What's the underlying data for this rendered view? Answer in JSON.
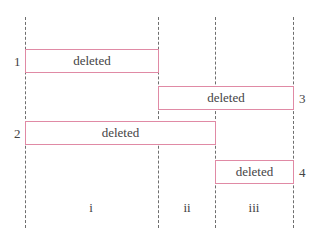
{
  "diagram": {
    "boxes": [
      {
        "id": "1",
        "label": "deleted"
      },
      {
        "id": "3",
        "label": "deleted"
      },
      {
        "id": "2",
        "label": "deleted"
      },
      {
        "id": "4",
        "label": "deleted"
      }
    ],
    "columns": [
      "i",
      "ii",
      "iii"
    ],
    "colors": {
      "box_border": "#e08aa5",
      "divider": "#6e6e6e"
    }
  }
}
